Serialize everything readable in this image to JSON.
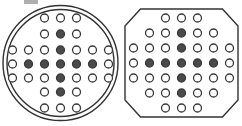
{
  "figure": {
    "background_color": "#ffffff",
    "outline_color": "#333333",
    "open_hole_fill": "#ffffff",
    "open_hole_stroke": "#3a3a3a",
    "filled_hole_fill": "#4a4a4a",
    "filled_hole_stroke": "#3a3a3a",
    "hole_radius": 4.0,
    "hole_stroke_width": 1.3
  },
  "shapes": [
    {
      "id": "circular-plate",
      "label": "Circular plate",
      "outline_type": "circle",
      "outline_style": "double-concentric-circle",
      "center": {
        "x": 60.5,
        "y": 63
      },
      "outer_radius": 57.5,
      "inner_radius": 53.5,
      "hole_count_total": 33,
      "filled_hole_count": 9,
      "open_hole_count": 24,
      "row_counts": [
        3,
        3,
        7,
        7,
        7,
        3,
        3
      ],
      "column_spacing": 16,
      "row_spacing": 16,
      "rows": [
        {
          "index": 1,
          "y": 18,
          "holes": [
            "open",
            "open",
            "open"
          ],
          "x_positions": [
            44.5,
            60.5,
            76.5
          ]
        },
        {
          "index": 2,
          "y": 34,
          "holes": [
            "open",
            "filled",
            "open"
          ],
          "x_positions": [
            44.5,
            60.5,
            76.5
          ]
        },
        {
          "index": 3,
          "y": 50,
          "holes": [
            "open",
            "open",
            "open",
            "filled",
            "open",
            "open",
            "open"
          ],
          "x_positions": [
            12.5,
            28.5,
            44.5,
            60.5,
            76.5,
            92.5,
            108.5
          ]
        },
        {
          "index": 4,
          "y": 64,
          "holes": [
            "open",
            "filled",
            "filled",
            "filled",
            "filled",
            "filled",
            "open"
          ],
          "x_positions": [
            12.5,
            28.5,
            44.5,
            60.5,
            76.5,
            92.5,
            108.5
          ]
        },
        {
          "index": 5,
          "y": 78,
          "holes": [
            "open",
            "open",
            "open",
            "filled",
            "open",
            "open",
            "open"
          ],
          "x_positions": [
            12.5,
            28.5,
            44.5,
            60.5,
            76.5,
            92.5,
            108.5
          ]
        },
        {
          "index": 6,
          "y": 92,
          "holes": [
            "open",
            "filled",
            "open"
          ],
          "x_positions": [
            44.5,
            60.5,
            76.5
          ]
        },
        {
          "index": 7,
          "y": 108,
          "holes": [
            "open",
            "open",
            "open"
          ],
          "x_positions": [
            44.5,
            60.5,
            76.5
          ]
        }
      ]
    },
    {
      "id": "octagonal-plate",
      "label": "Octagonal plate",
      "outline_type": "octagon",
      "outline_style": "single-regular-octagon",
      "center": {
        "x": 60.5,
        "y": 63
      },
      "circumradius": 58,
      "corner_cut": 17,
      "hole_count_total": 37,
      "filled_hole_count": 9,
      "open_hole_count": 28,
      "row_counts": [
        3,
        5,
        7,
        7,
        7,
        5,
        3
      ],
      "column_spacing": 16,
      "row_spacing": 16,
      "rows": [
        {
          "index": 1,
          "y": 18,
          "holes": [
            "open",
            "open",
            "open"
          ],
          "x_positions": [
            44.5,
            60.5,
            76.5
          ]
        },
        {
          "index": 2,
          "y": 33,
          "holes": [
            "open",
            "open",
            "filled",
            "open",
            "open"
          ],
          "x_positions": [
            28.5,
            44.5,
            60.5,
            76.5,
            92.5
          ]
        },
        {
          "index": 3,
          "y": 48,
          "holes": [
            "open",
            "open",
            "open",
            "filled",
            "open",
            "open",
            "open"
          ],
          "x_positions": [
            12.5,
            28.5,
            44.5,
            60.5,
            76.5,
            92.5,
            108.5
          ]
        },
        {
          "index": 4,
          "y": 63,
          "holes": [
            "open",
            "filled",
            "filled",
            "filled",
            "filled",
            "filled",
            "open"
          ],
          "x_positions": [
            12.5,
            28.5,
            44.5,
            60.5,
            76.5,
            92.5,
            108.5
          ]
        },
        {
          "index": 5,
          "y": 78,
          "holes": [
            "open",
            "open",
            "open",
            "filled",
            "open",
            "open",
            "open"
          ],
          "x_positions": [
            12.5,
            28.5,
            44.5,
            60.5,
            76.5,
            92.5,
            108.5
          ]
        },
        {
          "index": 6,
          "y": 93,
          "holes": [
            "open",
            "open",
            "filled",
            "open",
            "open"
          ],
          "x_positions": [
            28.5,
            44.5,
            60.5,
            76.5,
            92.5
          ]
        },
        {
          "index": 7,
          "y": 108,
          "holes": [
            "open",
            "open",
            "open"
          ],
          "x_positions": [
            44.5,
            60.5,
            76.5
          ]
        }
      ]
    }
  ]
}
